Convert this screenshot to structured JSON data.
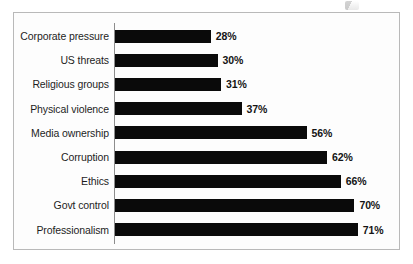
{
  "chart_data": {
    "type": "bar",
    "orientation": "horizontal",
    "title": "",
    "subtitle": "",
    "xlabel": "",
    "ylabel": "",
    "categories": [
      "Corporate pressure",
      "US threats",
      "Religious groups",
      "Physical violence",
      "Media ownership",
      "Corruption",
      "Ethics",
      "Govt control",
      "Professionalism"
    ],
    "values": [
      28,
      30,
      31,
      37,
      56,
      62,
      66,
      70,
      71
    ],
    "value_labels": [
      "28%",
      "30%",
      "31%",
      "37%",
      "56%",
      "62%",
      "66%",
      "70%",
      "71%"
    ],
    "value_unit": "%",
    "xlim": [
      0,
      100
    ],
    "grid": false,
    "legend": false,
    "legend_position": "none",
    "bar_color": "#0a0a0a",
    "axis_color": "#8d8d8d",
    "frame_color": "#b9b9b9",
    "background_color": "#fdfdfd",
    "tick_labels": []
  },
  "figure": {
    "artifact_name": "scan-speckle"
  }
}
